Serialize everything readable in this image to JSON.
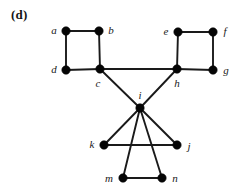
{
  "figure": {
    "panel_label": "(d)",
    "width": 244,
    "height": 189,
    "background_color": "#ffffff",
    "ink_color": "#1a1a1a"
  },
  "chart_data": {
    "type": "diagram",
    "diagram_kind": "undirected-graph",
    "title": "(d)",
    "xlabel": "",
    "ylabel": "",
    "node_radius": 4.2,
    "nodes": [
      {
        "id": "a",
        "label": "a",
        "x": 66,
        "y": 31,
        "label_x": 54,
        "label_y": 30
      },
      {
        "id": "b",
        "label": "b",
        "x": 99,
        "y": 31,
        "label_x": 111,
        "label_y": 30
      },
      {
        "id": "c",
        "label": "c",
        "x": 100,
        "y": 69,
        "label_x": 98,
        "label_y": 83
      },
      {
        "id": "d",
        "label": "d",
        "x": 66,
        "y": 70,
        "label_x": 54,
        "label_y": 69
      },
      {
        "id": "e",
        "label": "e",
        "x": 178,
        "y": 32,
        "label_x": 166,
        "label_y": 31
      },
      {
        "id": "f",
        "label": "f",
        "x": 213,
        "y": 32,
        "label_x": 225,
        "label_y": 31
      },
      {
        "id": "g",
        "label": "g",
        "x": 213,
        "y": 70,
        "label_x": 226,
        "label_y": 70
      },
      {
        "id": "h",
        "label": "h",
        "x": 177,
        "y": 69,
        "label_x": 177,
        "label_y": 83
      },
      {
        "id": "i",
        "label": "i",
        "x": 140,
        "y": 108,
        "label_x": 140,
        "label_y": 95
      },
      {
        "id": "j",
        "label": "j",
        "x": 177,
        "y": 145,
        "label_x": 189,
        "label_y": 146
      },
      {
        "id": "k",
        "label": "k",
        "x": 104,
        "y": 145,
        "label_x": 92,
        "label_y": 144
      },
      {
        "id": "m",
        "label": "m",
        "x": 123,
        "y": 178,
        "label_x": 109,
        "label_y": 178
      },
      {
        "id": "n",
        "label": "n",
        "x": 162,
        "y": 178,
        "label_x": 175,
        "label_y": 178
      }
    ],
    "edges": [
      {
        "source": "a",
        "target": "b"
      },
      {
        "source": "a",
        "target": "d"
      },
      {
        "source": "b",
        "target": "c"
      },
      {
        "source": "d",
        "target": "c"
      },
      {
        "source": "c",
        "target": "h"
      },
      {
        "source": "e",
        "target": "f"
      },
      {
        "source": "e",
        "target": "h"
      },
      {
        "source": "f",
        "target": "g"
      },
      {
        "source": "h",
        "target": "g"
      },
      {
        "source": "c",
        "target": "i"
      },
      {
        "source": "h",
        "target": "i"
      },
      {
        "source": "i",
        "target": "k"
      },
      {
        "source": "i",
        "target": "j"
      },
      {
        "source": "i",
        "target": "m"
      },
      {
        "source": "i",
        "target": "n"
      },
      {
        "source": "k",
        "target": "j"
      },
      {
        "source": "m",
        "target": "n"
      }
    ]
  }
}
